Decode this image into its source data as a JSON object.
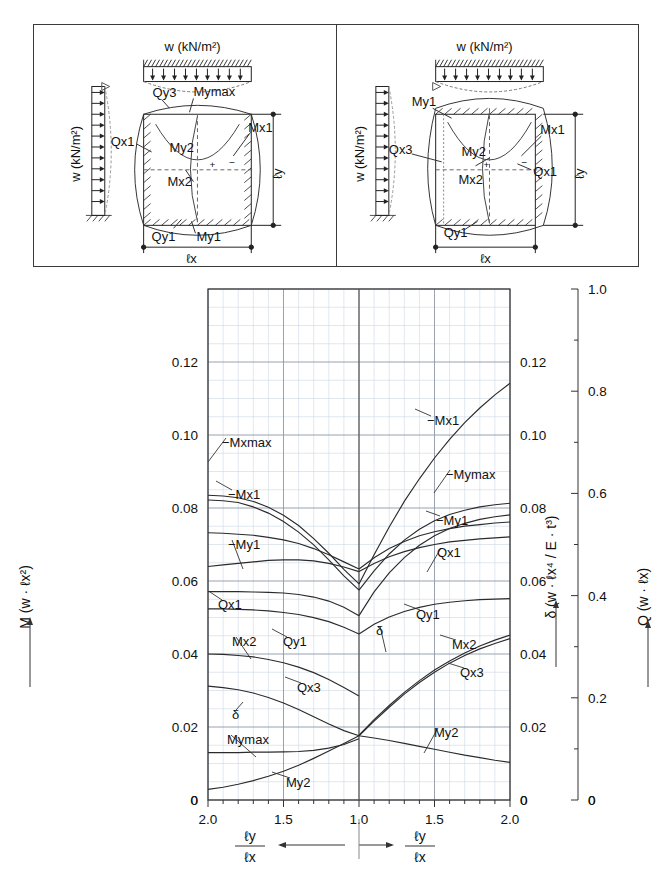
{
  "figure": {
    "diagram_panel": {
      "left": {
        "load_label": "w (kN/m²)",
        "side_load_label": "w (kN/m²)",
        "dim_x": "ℓx",
        "dim_y": "ℓy",
        "annotations": [
          "Qy3",
          "Mymax",
          "Qx1",
          "My2",
          "Mx1",
          "Mx2",
          "Qy1",
          "My1"
        ],
        "signs": [
          "+",
          "−"
        ]
      },
      "right": {
        "load_label": "w (kN/m²)",
        "side_load_label": "w (kN/m²)",
        "dim_x": "ℓx",
        "dim_y": "ℓy",
        "annotations": [
          "My1",
          "Qx3",
          "My2",
          "Mx1",
          "Mx2",
          "Qx1",
          "Qy1"
        ],
        "signs": [
          "+",
          "−"
        ]
      }
    }
  },
  "chart_data": {
    "type": "line",
    "title": "",
    "grid": true,
    "legend": "inline-curve-labels",
    "xlabel_left": "ℓy / ℓx",
    "xlabel_right": "ℓy / ℓx",
    "x_axis": {
      "left_branch": {
        "from": 2.0,
        "to": 1.0
      },
      "right_branch": {
        "from": 1.0,
        "to": 2.0
      },
      "tick_labels": [
        "2.0",
        "1.5",
        "1.0",
        "1.5",
        "2.0"
      ],
      "tick_positions": [
        0.0,
        0.25,
        0.5,
        0.75,
        1.0
      ],
      "minor_ticks_per_major": 5
    },
    "y_axis_left": {
      "label": "M  (w · ℓx²)",
      "symbol": "M",
      "unit": "(w · ℓx²)",
      "ticks": [
        "0",
        "0.02",
        "0.04",
        "0.06",
        "0.08",
        "0.10",
        "0.12"
      ],
      "tick_values": [
        0,
        0.02,
        0.04,
        0.06,
        0.08,
        0.1,
        0.12
      ],
      "min": 0,
      "max": 0.14,
      "minor_step": 0.005
    },
    "y_axis_right_1": {
      "label": "δ  (w · ℓx⁴ / E · t³)",
      "symbol": "δ",
      "unit": "(w · ℓx⁴ / E · t³)",
      "ticks": [
        "0",
        "0.02",
        "0.04",
        "0.06",
        "0.08",
        "0.10",
        "0.12"
      ],
      "tick_values": [
        0,
        0.02,
        0.04,
        0.06,
        0.08,
        0.1,
        0.12
      ],
      "min": 0,
      "max": 0.14
    },
    "y_axis_right_2": {
      "label": "Q  (w · ℓx)",
      "symbol": "Q",
      "unit": "(w · ℓx)",
      "ticks": [
        "0",
        "0.2",
        "0.4",
        "0.6",
        "0.8",
        "1.0"
      ],
      "tick_values": [
        0,
        0.2,
        0.4,
        0.6,
        0.8,
        1.0
      ],
      "min": 0,
      "max": 1.0
    },
    "curve_labels_left": [
      "−Mxmax",
      "−Mx1",
      "−My1",
      "Qx1",
      "Mx2",
      "Qy1",
      "Qx3",
      "δ",
      "Mymax",
      "My2"
    ],
    "curve_labels_right": [
      "−Mx1",
      "−Mymax",
      "−My1",
      "Qx1",
      "Qy1",
      "δ",
      "Mx2",
      "Qx3",
      "My2"
    ],
    "series": [
      {
        "name": "-Mxmax",
        "branch": "left",
        "axis": "M",
        "points": [
          [
            2.0,
            0.0835
          ],
          [
            1.9,
            0.0833
          ],
          [
            1.8,
            0.0828
          ],
          [
            1.7,
            0.0818
          ],
          [
            1.6,
            0.0802
          ],
          [
            1.5,
            0.078
          ],
          [
            1.4,
            0.0752
          ],
          [
            1.3,
            0.0716
          ],
          [
            1.2,
            0.0676
          ],
          [
            1.1,
            0.0632
          ],
          [
            1.0,
            0.0592
          ]
        ]
      },
      {
        "name": "-Mx1",
        "branch": "left",
        "axis": "M",
        "points": [
          [
            2.0,
            0.0822
          ],
          [
            1.9,
            0.082
          ],
          [
            1.8,
            0.0815
          ],
          [
            1.7,
            0.0803
          ],
          [
            1.6,
            0.0786
          ],
          [
            1.5,
            0.0763
          ],
          [
            1.4,
            0.0734
          ],
          [
            1.3,
            0.0699
          ],
          [
            1.2,
            0.0658
          ],
          [
            1.1,
            0.0614
          ],
          [
            1.0,
            0.0575
          ]
        ]
      },
      {
        "name": "-My1",
        "branch": "left",
        "axis": "M",
        "points": [
          [
            2.0,
            0.0571
          ],
          [
            1.9,
            0.0571
          ],
          [
            1.8,
            0.0571
          ],
          [
            1.7,
            0.057
          ],
          [
            1.6,
            0.0569
          ],
          [
            1.5,
            0.0567
          ],
          [
            1.4,
            0.0563
          ],
          [
            1.3,
            0.0556
          ],
          [
            1.2,
            0.0545
          ],
          [
            1.1,
            0.0528
          ],
          [
            1.0,
            0.0505
          ]
        ]
      },
      {
        "name": "Qx1",
        "branch": "left",
        "axis": "Q",
        "points": [
          [
            2.0,
            0.523
          ],
          [
            1.9,
            0.522
          ],
          [
            1.8,
            0.52
          ],
          [
            1.7,
            0.518
          ],
          [
            1.6,
            0.514
          ],
          [
            1.5,
            0.509
          ],
          [
            1.4,
            0.502
          ],
          [
            1.3,
            0.492
          ],
          [
            1.2,
            0.48
          ],
          [
            1.1,
            0.466
          ],
          [
            1.0,
            0.452
          ]
        ]
      },
      {
        "name": "Qy1-left",
        "branch": "left",
        "axis": "Q",
        "points": [
          [
            2.0,
            0.457
          ],
          [
            1.9,
            0.46
          ],
          [
            1.8,
            0.463
          ],
          [
            1.7,
            0.466
          ],
          [
            1.6,
            0.469
          ],
          [
            1.5,
            0.47
          ],
          [
            1.4,
            0.47
          ],
          [
            1.3,
            0.468
          ],
          [
            1.2,
            0.463
          ],
          [
            1.1,
            0.456
          ],
          [
            1.0,
            0.447
          ]
        ]
      },
      {
        "name": "Mx2",
        "branch": "left",
        "axis": "M",
        "points": [
          [
            2.0,
            0.04
          ],
          [
            1.9,
            0.0399
          ],
          [
            1.8,
            0.0396
          ],
          [
            1.7,
            0.0392
          ],
          [
            1.6,
            0.0385
          ],
          [
            1.5,
            0.0376
          ],
          [
            1.4,
            0.0364
          ],
          [
            1.3,
            0.0349
          ],
          [
            1.2,
            0.033
          ],
          [
            1.1,
            0.0308
          ],
          [
            1.0,
            0.0285
          ]
        ]
      },
      {
        "name": "Qx3",
        "branch": "left",
        "axis": "Q",
        "points": [
          [
            2.0,
            0.374
          ],
          [
            1.9,
            0.374
          ],
          [
            1.8,
            0.373
          ],
          [
            1.7,
            0.372
          ],
          [
            1.6,
            0.37
          ],
          [
            1.5,
            0.367
          ],
          [
            1.4,
            0.363
          ],
          [
            1.3,
            0.357
          ],
          [
            1.2,
            0.349
          ],
          [
            1.1,
            0.338
          ],
          [
            1.0,
            0.325
          ]
        ]
      },
      {
        "name": "delta-left",
        "branch": "left",
        "axis": "delta",
        "points": [
          [
            2.0,
            0.0312
          ],
          [
            1.9,
            0.0308
          ],
          [
            1.8,
            0.0302
          ],
          [
            1.7,
            0.0293
          ],
          [
            1.6,
            0.0281
          ],
          [
            1.5,
            0.0266
          ],
          [
            1.4,
            0.0248
          ],
          [
            1.3,
            0.0228
          ],
          [
            1.2,
            0.0208
          ],
          [
            1.1,
            0.019
          ],
          [
            1.0,
            0.0176
          ]
        ]
      },
      {
        "name": "Mymax",
        "branch": "left",
        "axis": "M",
        "points": [
          [
            2.0,
            0.013
          ],
          [
            1.9,
            0.013
          ],
          [
            1.8,
            0.013
          ],
          [
            1.7,
            0.0131
          ],
          [
            1.6,
            0.0131
          ],
          [
            1.5,
            0.0132
          ],
          [
            1.4,
            0.0133
          ],
          [
            1.3,
            0.0136
          ],
          [
            1.2,
            0.0142
          ],
          [
            1.1,
            0.0152
          ],
          [
            1.0,
            0.0168
          ]
        ]
      },
      {
        "name": "My2-left",
        "branch": "left",
        "axis": "M",
        "points": [
          [
            2.0,
            0.0029
          ],
          [
            1.9,
            0.0035
          ],
          [
            1.8,
            0.0043
          ],
          [
            1.7,
            0.0053
          ],
          [
            1.6,
            0.0065
          ],
          [
            1.5,
            0.0079
          ],
          [
            1.4,
            0.0095
          ],
          [
            1.3,
            0.0114
          ],
          [
            1.2,
            0.0134
          ],
          [
            1.1,
            0.0155
          ],
          [
            1.0,
            0.0176
          ]
        ]
      },
      {
        "name": "-Mx1-right",
        "branch": "right",
        "axis": "M",
        "points": [
          [
            1.0,
            0.0592
          ],
          [
            1.1,
            0.0672
          ],
          [
            1.2,
            0.0748
          ],
          [
            1.3,
            0.0818
          ],
          [
            1.4,
            0.088
          ],
          [
            1.5,
            0.0937
          ],
          [
            1.6,
            0.0988
          ],
          [
            1.7,
            0.1034
          ],
          [
            1.8,
            0.1074
          ],
          [
            1.9,
            0.111
          ],
          [
            2.0,
            0.1142
          ]
        ]
      },
      {
        "name": "-Mymax-right",
        "branch": "right",
        "axis": "M",
        "points": [
          [
            1.0,
            0.0575
          ],
          [
            1.1,
            0.0628
          ],
          [
            1.2,
            0.0674
          ],
          [
            1.3,
            0.0712
          ],
          [
            1.4,
            0.0742
          ],
          [
            1.5,
            0.0765
          ],
          [
            1.6,
            0.0782
          ],
          [
            1.7,
            0.0794
          ],
          [
            1.8,
            0.0803
          ],
          [
            1.9,
            0.0809
          ],
          [
            2.0,
            0.0813
          ]
        ]
      },
      {
        "name": "-My1-right",
        "branch": "right",
        "axis": "M",
        "points": [
          [
            1.0,
            0.0505
          ],
          [
            1.1,
            0.057
          ],
          [
            1.2,
            0.0622
          ],
          [
            1.3,
            0.0664
          ],
          [
            1.4,
            0.0698
          ],
          [
            1.5,
            0.0724
          ],
          [
            1.6,
            0.0744
          ],
          [
            1.7,
            0.0758
          ],
          [
            1.8,
            0.0769
          ],
          [
            1.9,
            0.0776
          ],
          [
            2.0,
            0.0781
          ]
        ]
      },
      {
        "name": "Qx1-right",
        "branch": "right",
        "axis": "Q",
        "points": [
          [
            1.0,
            0.452
          ],
          [
            1.1,
            0.474
          ],
          [
            1.2,
            0.492
          ],
          [
            1.3,
            0.506
          ],
          [
            1.4,
            0.517
          ],
          [
            1.5,
            0.525
          ],
          [
            1.6,
            0.531
          ],
          [
            1.7,
            0.536
          ],
          [
            1.8,
            0.539
          ],
          [
            1.9,
            0.542
          ],
          [
            2.0,
            0.544
          ]
        ]
      },
      {
        "name": "Qy1-right",
        "branch": "right",
        "axis": "Q",
        "points": [
          [
            1.0,
            0.447
          ],
          [
            1.1,
            0.463
          ],
          [
            1.2,
            0.476
          ],
          [
            1.3,
            0.486
          ],
          [
            1.4,
            0.494
          ],
          [
            1.5,
            0.5
          ],
          [
            1.6,
            0.505
          ],
          [
            1.7,
            0.508
          ],
          [
            1.8,
            0.511
          ],
          [
            1.9,
            0.513
          ],
          [
            2.0,
            0.515
          ]
        ]
      },
      {
        "name": "delta-right",
        "branch": "right",
        "axis": "delta",
        "points": [
          [
            1.0,
            0.0176
          ],
          [
            1.1,
            0.0216
          ],
          [
            1.2,
            0.0254
          ],
          [
            1.3,
            0.029
          ],
          [
            1.4,
            0.0322
          ],
          [
            1.5,
            0.035
          ],
          [
            1.6,
            0.0375
          ],
          [
            1.7,
            0.0396
          ],
          [
            1.8,
            0.0414
          ],
          [
            1.9,
            0.0429
          ],
          [
            2.0,
            0.0442
          ]
        ]
      },
      {
        "name": "Mx2-right",
        "branch": "right",
        "axis": "M",
        "points": [
          [
            1.0,
            0.0178
          ],
          [
            1.1,
            0.022
          ],
          [
            1.2,
            0.0259
          ],
          [
            1.3,
            0.0295
          ],
          [
            1.4,
            0.0327
          ],
          [
            1.5,
            0.0356
          ],
          [
            1.6,
            0.0381
          ],
          [
            1.7,
            0.0403
          ],
          [
            1.8,
            0.0422
          ],
          [
            1.9,
            0.0438
          ],
          [
            2.0,
            0.0452
          ]
        ]
      },
      {
        "name": "Qx3-right",
        "branch": "right",
        "axis": "Q",
        "points": [
          [
            1.0,
            0.325
          ],
          [
            1.1,
            0.344
          ],
          [
            1.2,
            0.358
          ],
          [
            1.3,
            0.369
          ],
          [
            1.4,
            0.377
          ],
          [
            1.5,
            0.383
          ],
          [
            1.6,
            0.387
          ],
          [
            1.7,
            0.39
          ],
          [
            1.8,
            0.392
          ],
          [
            1.9,
            0.393
          ],
          [
            2.0,
            0.394
          ]
        ]
      },
      {
        "name": "My2-right",
        "branch": "right",
        "axis": "M",
        "points": [
          [
            1.0,
            0.0176
          ],
          [
            1.1,
            0.017
          ],
          [
            1.2,
            0.0163
          ],
          [
            1.3,
            0.0155
          ],
          [
            1.4,
            0.0147
          ],
          [
            1.5,
            0.0139
          ],
          [
            1.6,
            0.0131
          ],
          [
            1.7,
            0.0123
          ],
          [
            1.8,
            0.0116
          ],
          [
            1.9,
            0.0109
          ],
          [
            2.0,
            0.0103
          ]
        ]
      }
    ]
  }
}
